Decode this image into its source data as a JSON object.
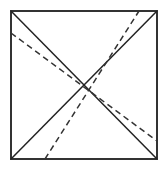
{
  "figure": {
    "title": "Square with two solid diagonals and two dashed lines",
    "caption": "",
    "background_color": "#ffffff",
    "canvas": {
      "width": 168,
      "height": 173
    },
    "square": {
      "name": "outer-square",
      "left": 11,
      "top": 11,
      "right": 157,
      "bottom": 159,
      "stroke_color": "#333333",
      "stroke_width": 1.6,
      "fill": "none",
      "corners": {
        "top_left": [
          11,
          11
        ],
        "top_right": [
          157,
          11
        ],
        "bottom_right": [
          157,
          159
        ],
        "bottom_left": [
          11,
          159
        ]
      }
    },
    "solid_lines": [
      {
        "name": "diagonal-top-left-to-bottom-right",
        "x1": 11,
        "y1": 11,
        "x2": 157,
        "y2": 159,
        "stroke_color": "#222222",
        "stroke_width": 1.5,
        "style": "solid"
      },
      {
        "name": "diagonal-bottom-left-to-top-right",
        "x1": 11,
        "y1": 159,
        "x2": 157,
        "y2": 11,
        "stroke_color": "#222222",
        "stroke_width": 1.5,
        "style": "solid"
      }
    ],
    "dashed_lines": [
      {
        "name": "dashed-descending-line",
        "x1": 11,
        "y1": 33,
        "x2": 157,
        "y2": 141,
        "stroke_color": "#333333",
        "stroke_width": 1.5,
        "style": "dashed",
        "dash_pattern": "6 4"
      },
      {
        "name": "dashed-ascending-line",
        "x1": 45,
        "y1": 159,
        "x2": 139,
        "y2": 11,
        "stroke_color": "#333333",
        "stroke_width": 1.5,
        "style": "dashed",
        "dash_pattern": "6 4"
      }
    ],
    "labels": []
  }
}
